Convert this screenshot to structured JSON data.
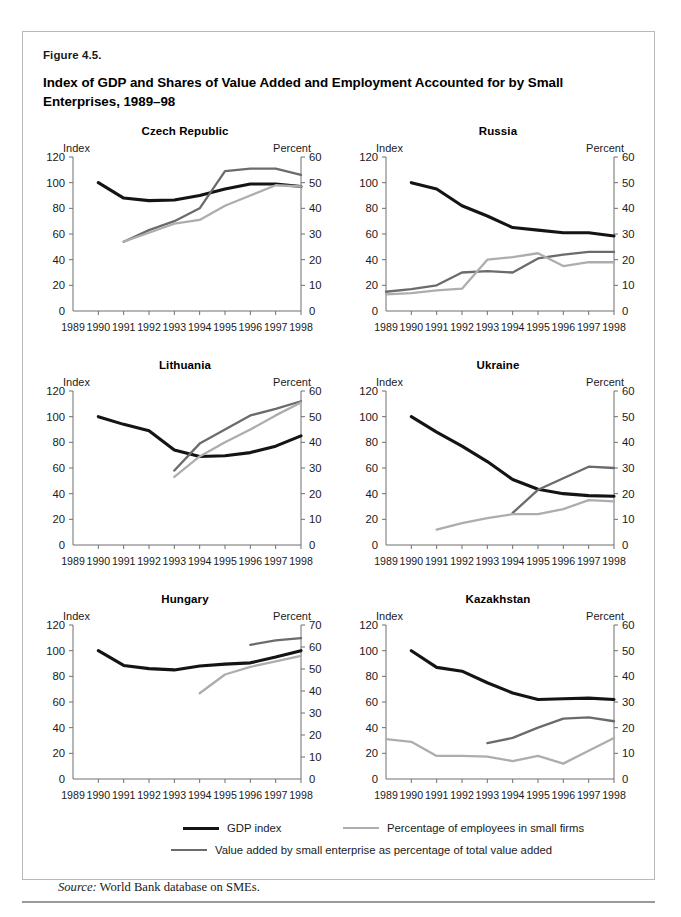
{
  "figure": {
    "number": "Figure 4.5.",
    "title": "Index of GDP and Shares of Value Added and Employment Accounted for by Small Enterprises, 1989–98",
    "source_prefix": "Source:",
    "source_text": " World Bank database on SMEs."
  },
  "colors": {
    "gdp": "#141414",
    "value_added": "#6b6b6b",
    "employees": "#adadad",
    "axis": "#6f6f6f",
    "text": "#1a1a1a",
    "border": "#b9b9b9"
  },
  "legend": [
    {
      "key": "gdp",
      "label": "GDP index",
      "color": "#141414",
      "width": 3.1
    },
    {
      "key": "employees",
      "label": "Percentage of employees in small firms",
      "color": "#adadad",
      "width": 2.4
    },
    {
      "key": "value_added",
      "label": "Value added by small enterprise as percentage of total value added",
      "color": "#6b6b6b",
      "width": 2.4
    }
  ],
  "axis_titles": {
    "left": "Index",
    "right": "Percent"
  },
  "x_ticks": [
    "1989",
    "1990",
    "1991",
    "1992",
    "1993",
    "1994",
    "1995",
    "1996",
    "1997",
    "1998"
  ],
  "chart_data": [
    {
      "type": "line",
      "title": "Czech Republic",
      "xlabel": "",
      "ylabel": "Index",
      "y2label": "Percent",
      "x": [
        1989,
        1990,
        1991,
        1992,
        1993,
        1994,
        1995,
        1996,
        1997,
        1998
      ],
      "ylim": [
        0,
        120
      ],
      "yticks": [
        0,
        20,
        40,
        60,
        80,
        100,
        120
      ],
      "y2lim": [
        0,
        60
      ],
      "y2ticks": [
        0,
        10,
        20,
        30,
        40,
        50,
        60
      ],
      "grid": false,
      "legend_position": "bottom",
      "series": [
        {
          "name": "GDP index",
          "axis": "left",
          "color": "#141414",
          "x": [
            1990,
            1991,
            1992,
            1993,
            1994,
            1995,
            1996,
            1997,
            1998
          ],
          "values": [
            100,
            88,
            86,
            86.5,
            90,
            95,
            99,
            99,
            97
          ]
        },
        {
          "name": "Value added by small enterprise as percentage of total value added",
          "axis": "right",
          "color": "#6b6b6b",
          "x": [
            1991,
            1992,
            1993,
            1994,
            1995,
            1996,
            1997,
            1998
          ],
          "values": [
            27,
            31.5,
            35,
            40,
            54.5,
            55.5,
            55.5,
            53
          ]
        },
        {
          "name": "Percentage of employees in small firms",
          "axis": "right",
          "color": "#adadad",
          "x": [
            1991,
            1992,
            1993,
            1994,
            1995,
            1996,
            1997,
            1998
          ],
          "values": [
            27,
            30.5,
            34,
            35.5,
            41,
            45,
            49,
            48.5
          ]
        }
      ]
    },
    {
      "type": "line",
      "title": "Russia",
      "xlabel": "",
      "ylabel": "Index",
      "y2label": "Percent",
      "x": [
        1989,
        1990,
        1991,
        1992,
        1993,
        1994,
        1995,
        1996,
        1997,
        1998
      ],
      "ylim": [
        0,
        120
      ],
      "yticks": [
        0,
        20,
        40,
        60,
        80,
        100,
        120
      ],
      "y2lim": [
        0,
        60
      ],
      "y2ticks": [
        0,
        10,
        20,
        30,
        40,
        50,
        60
      ],
      "grid": false,
      "legend_position": "bottom",
      "series": [
        {
          "name": "GDP index",
          "axis": "left",
          "color": "#141414",
          "x": [
            1990,
            1991,
            1992,
            1993,
            1994,
            1995,
            1996,
            1997,
            1998
          ],
          "values": [
            100,
            95,
            82,
            74,
            65,
            63,
            61,
            61,
            58.5
          ]
        },
        {
          "name": "Value added by small enterprise as percentage of total value added",
          "axis": "right",
          "color": "#6b6b6b",
          "x": [
            1989,
            1990,
            1991,
            1992,
            1993,
            1994,
            1995,
            1996,
            1997,
            1998
          ],
          "values": [
            7.5,
            8.5,
            10,
            15,
            15.5,
            15,
            20.5,
            22,
            23,
            23
          ]
        },
        {
          "name": "Percentage of employees in small firms",
          "axis": "right",
          "color": "#adadad",
          "x": [
            1989,
            1990,
            1991,
            1992,
            1993,
            1994,
            1995,
            1996,
            1997,
            1998
          ],
          "values": [
            6.5,
            7,
            8,
            8.7,
            20,
            21,
            22.5,
            17.5,
            19,
            19
          ]
        }
      ]
    },
    {
      "type": "line",
      "title": "Lithuania",
      "xlabel": "",
      "ylabel": "Index",
      "y2label": "Percent",
      "x": [
        1989,
        1990,
        1991,
        1992,
        1993,
        1994,
        1995,
        1996,
        1997,
        1998
      ],
      "ylim": [
        0,
        120
      ],
      "yticks": [
        0,
        20,
        40,
        60,
        80,
        100,
        120
      ],
      "y2lim": [
        0,
        60
      ],
      "y2ticks": [
        0,
        10,
        20,
        30,
        40,
        50,
        60
      ],
      "grid": false,
      "legend_position": "bottom",
      "series": [
        {
          "name": "GDP index",
          "axis": "left",
          "color": "#141414",
          "x": [
            1990,
            1991,
            1992,
            1993,
            1994,
            1995,
            1996,
            1997,
            1998
          ],
          "values": [
            100,
            94,
            89,
            74,
            69,
            69.5,
            72,
            77,
            85
          ]
        },
        {
          "name": "Value added by small enterprise as percentage of total value added",
          "axis": "right",
          "color": "#6b6b6b",
          "x": [
            1993,
            1994,
            1995,
            1996,
            1997,
            1998
          ],
          "values": [
            29,
            39.5,
            45,
            50.5,
            53,
            56
          ]
        },
        {
          "name": "Percentage of employees in small firms",
          "axis": "right",
          "color": "#adadad",
          "x": [
            1993,
            1994,
            1995,
            1996,
            1997,
            1998
          ],
          "values": [
            26.5,
            34.5,
            40,
            45,
            50.5,
            55.5
          ]
        }
      ]
    },
    {
      "type": "line",
      "title": "Ukraine",
      "xlabel": "",
      "ylabel": "Index",
      "y2label": "Percent",
      "x": [
        1989,
        1990,
        1991,
        1992,
        1993,
        1994,
        1995,
        1996,
        1997,
        1998
      ],
      "ylim": [
        0,
        120
      ],
      "yticks": [
        0,
        20,
        40,
        60,
        80,
        100,
        120
      ],
      "y2lim": [
        0,
        60
      ],
      "y2ticks": [
        0,
        10,
        20,
        30,
        40,
        50,
        60
      ],
      "grid": false,
      "legend_position": "bottom",
      "series": [
        {
          "name": "GDP index",
          "axis": "left",
          "color": "#141414",
          "x": [
            1990,
            1991,
            1992,
            1993,
            1994,
            1995,
            1996,
            1997,
            1998
          ],
          "values": [
            100,
            88,
            77,
            65,
            51,
            43.5,
            40,
            38.5,
            38
          ]
        },
        {
          "name": "Value added by small enterprise as percentage of total value added",
          "axis": "right",
          "color": "#6b6b6b",
          "x": [
            1994,
            1995,
            1996,
            1997,
            1998
          ],
          "values": [
            12.5,
            21.5,
            26,
            30.5,
            30
          ]
        },
        {
          "name": "Percentage of employees in small firms",
          "axis": "right",
          "color": "#adadad",
          "x": [
            1991,
            1992,
            1993,
            1994,
            1995,
            1996,
            1997,
            1998
          ],
          "values": [
            6,
            8.5,
            10.5,
            12,
            12,
            14,
            17.5,
            17
          ]
        }
      ]
    },
    {
      "type": "line",
      "title": "Hungary",
      "xlabel": "",
      "ylabel": "Index",
      "y2label": "Percent",
      "x": [
        1989,
        1990,
        1991,
        1992,
        1993,
        1994,
        1995,
        1996,
        1997,
        1998
      ],
      "ylim": [
        0,
        120
      ],
      "yticks": [
        0,
        20,
        40,
        60,
        80,
        100,
        120
      ],
      "y2lim": [
        0,
        70
      ],
      "y2ticks": [
        0,
        10,
        20,
        30,
        40,
        50,
        60,
        70
      ],
      "grid": false,
      "legend_position": "bottom",
      "series": [
        {
          "name": "GDP index",
          "axis": "left",
          "color": "#141414",
          "x": [
            1990,
            1991,
            1992,
            1993,
            1994,
            1995,
            1996,
            1997,
            1998
          ],
          "values": [
            100,
            88.5,
            86,
            85,
            88,
            89.5,
            90.5,
            95,
            100
          ]
        },
        {
          "name": "Value added by small enterprise as percentage of total value added",
          "axis": "right",
          "color": "#6b6b6b",
          "x": [
            1996,
            1997,
            1998
          ],
          "values": [
            61,
            63,
            64
          ]
        },
        {
          "name": "Percentage of employees in small firms",
          "axis": "right",
          "color": "#adadad",
          "x": [
            1994,
            1995,
            1996,
            1997,
            1998
          ],
          "values": [
            39,
            47.5,
            51,
            53.5,
            56
          ]
        }
      ]
    },
    {
      "type": "line",
      "title": "Kazakhstan",
      "xlabel": "",
      "ylabel": "Index",
      "y2label": "Percent",
      "x": [
        1989,
        1990,
        1991,
        1992,
        1993,
        1994,
        1995,
        1996,
        1997,
        1998
      ],
      "ylim": [
        0,
        120
      ],
      "yticks": [
        0,
        20,
        40,
        60,
        80,
        100,
        120
      ],
      "y2lim": [
        0,
        60
      ],
      "y2ticks": [
        0,
        10,
        20,
        30,
        40,
        50,
        60
      ],
      "grid": false,
      "legend_position": "bottom",
      "series": [
        {
          "name": "GDP index",
          "axis": "left",
          "color": "#141414",
          "x": [
            1990,
            1991,
            1992,
            1993,
            1994,
            1995,
            1996,
            1997,
            1998
          ],
          "values": [
            100,
            87,
            84,
            75,
            67,
            62,
            62.5,
            63,
            62
          ]
        },
        {
          "name": "Value added by small enterprise as percentage of total value added",
          "axis": "right",
          "color": "#6b6b6b",
          "x": [
            1993,
            1994,
            1995,
            1996,
            1997,
            1998
          ],
          "values": [
            14,
            16,
            20,
            23.5,
            24,
            22.5
          ]
        },
        {
          "name": "Percentage of employees in small firms",
          "axis": "right",
          "color": "#adadad",
          "x": [
            1989,
            1990,
            1991,
            1992,
            1993,
            1994,
            1995,
            1996,
            1997,
            1998
          ],
          "values": [
            15.5,
            14.5,
            9,
            9,
            8.7,
            7,
            9,
            6,
            11,
            16
          ]
        }
      ]
    }
  ]
}
